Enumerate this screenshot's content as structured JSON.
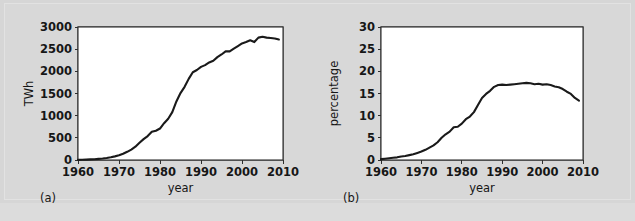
{
  "figure": {
    "background_color": "#d6d6d6",
    "plot_background_color": "#ffffff",
    "line_color": "#1a1a1a",
    "grid_color": "#b4b4b4",
    "axis_color": "#2e2e2e"
  },
  "panels": [
    {
      "caption": "(a)",
      "ylabel": "TWh",
      "xlabel": "year",
      "ytick_labels": [
        "0",
        "500",
        "1000",
        "1500",
        "2000",
        "2500",
        "3000"
      ],
      "xtick_labels": [
        "1960",
        "1970",
        "1980",
        "1990",
        "2000",
        "2010"
      ]
    },
    {
      "caption": "(b)",
      "ylabel": "percentage",
      "xlabel": "year",
      "ytick_labels": [
        "0",
        "5",
        "10",
        "15",
        "20",
        "25",
        "30"
      ],
      "xtick_labels": [
        "1960",
        "1970",
        "1980",
        "1990",
        "2000",
        "2010"
      ]
    }
  ],
  "chart_data": [
    {
      "type": "line",
      "title": "",
      "xlabel": "year",
      "ylabel": "TWh",
      "xlim": [
        1960,
        2010
      ],
      "ylim": [
        0,
        3000
      ],
      "xticks": [
        1960,
        1970,
        1980,
        1990,
        2000,
        2010
      ],
      "yticks": [
        0,
        500,
        1000,
        1500,
        2000,
        2500,
        3000
      ],
      "grid": true,
      "legend": "none",
      "panel": "(a)",
      "x": [
        1960,
        1961,
        1962,
        1963,
        1964,
        1965,
        1966,
        1967,
        1968,
        1969,
        1970,
        1971,
        1972,
        1973,
        1974,
        1975,
        1976,
        1977,
        1978,
        1979,
        1980,
        1981,
        1982,
        1983,
        1984,
        1985,
        1986,
        1987,
        1988,
        1989,
        1990,
        1991,
        1992,
        1993,
        1994,
        1995,
        1996,
        1997,
        1998,
        1999,
        2000,
        2001,
        2002,
        2003,
        2004,
        2005,
        2006,
        2007,
        2008,
        2009
      ],
      "values": [
        2,
        5,
        9,
        13,
        18,
        25,
        33,
        45,
        62,
        82,
        105,
        140,
        185,
        235,
        300,
        390,
        470,
        540,
        635,
        660,
        710,
        830,
        930,
        1080,
        1320,
        1510,
        1650,
        1830,
        1980,
        2030,
        2100,
        2140,
        2200,
        2240,
        2320,
        2380,
        2450,
        2450,
        2510,
        2570,
        2630,
        2660,
        2700,
        2660,
        2760,
        2780,
        2760,
        2750,
        2740,
        2720
      ]
    },
    {
      "type": "line",
      "title": "",
      "xlabel": "year",
      "ylabel": "percentage",
      "xlim": [
        1960,
        2010
      ],
      "ylim": [
        0,
        30
      ],
      "xticks": [
        1960,
        1970,
        1980,
        1990,
        2000,
        2010
      ],
      "yticks": [
        0,
        5,
        10,
        15,
        20,
        25,
        30
      ],
      "grid": true,
      "legend": "none",
      "panel": "(b)",
      "x": [
        1960,
        1961,
        1962,
        1963,
        1964,
        1965,
        1966,
        1967,
        1968,
        1969,
        1970,
        1971,
        1972,
        1973,
        1974,
        1975,
        1976,
        1977,
        1978,
        1979,
        1980,
        1981,
        1982,
        1983,
        1984,
        1985,
        1986,
        1987,
        1988,
        1989,
        1990,
        1991,
        1992,
        1993,
        1994,
        1995,
        1996,
        1997,
        1998,
        1999,
        2000,
        2001,
        2002,
        2003,
        2004,
        2005,
        2006,
        2007,
        2008,
        2009
      ],
      "values": [
        0.2,
        0.3,
        0.4,
        0.5,
        0.6,
        0.8,
        0.9,
        1.1,
        1.3,
        1.6,
        1.9,
        2.3,
        2.8,
        3.3,
        4.0,
        5.0,
        5.8,
        6.4,
        7.4,
        7.5,
        8.2,
        9.2,
        9.8,
        10.8,
        12.4,
        14.0,
        14.9,
        15.6,
        16.5,
        16.9,
        17.0,
        16.9,
        17.0,
        17.1,
        17.2,
        17.3,
        17.4,
        17.3,
        17.1,
        17.2,
        17.0,
        17.1,
        16.9,
        16.6,
        16.4,
        16.0,
        15.4,
        14.9,
        14.0,
        13.4
      ]
    }
  ]
}
